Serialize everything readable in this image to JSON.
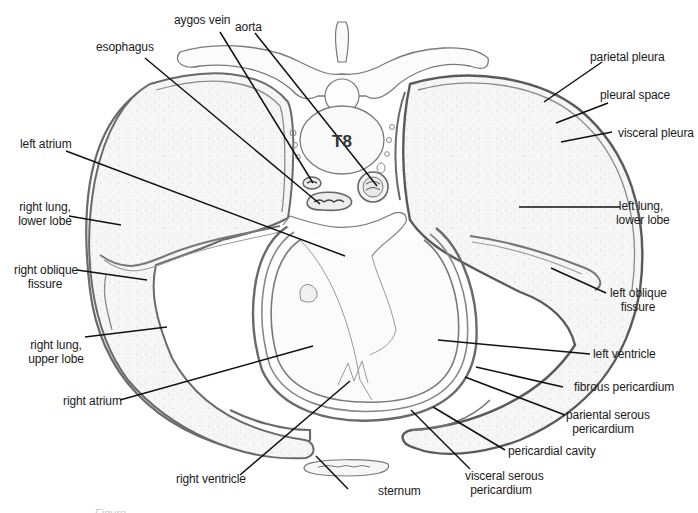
{
  "figure": {
    "vertebra_label": "T8",
    "caption_fragment": "Figure",
    "colors": {
      "outline": "#6e6e6e",
      "leader": "#111111",
      "tissue_fill": "#f4f4f4",
      "background": "#ffffff"
    }
  },
  "labels": {
    "aygos_vein": "aygos vein",
    "aorta": "aorta",
    "esophagus": "esophagus",
    "left_atrium": "left atrium",
    "right_lung_lower_1": "right lung,",
    "right_lung_lower_2": "lower lobe",
    "right_oblique_1": "right oblique",
    "right_oblique_2": "fissure",
    "right_lung_upper_1": "right lung,",
    "right_lung_upper_2": "upper lobe",
    "right_atrium": "right atrium",
    "right_ventricle": "right ventricle",
    "sternum": "sternum",
    "visceral_serous_1": "visceral serous",
    "visceral_serous_2": "pericardium",
    "pericardial_cavity": "pericardial cavity",
    "pariental_serous_1": "pariental serous",
    "pariental_serous_2": "pericardium",
    "fibrous_pericardium": "fibrous pericardium",
    "left_ventricle": "left ventricle",
    "left_oblique_1": "left oblique",
    "left_oblique_2": "fissure",
    "left_lung_lower_1": "left lung,",
    "left_lung_lower_2": "lower lobe",
    "visceral_pleura": "visceral pleura",
    "pleural_space": "pleural space",
    "parietal_pleura": "parietal pleura"
  }
}
